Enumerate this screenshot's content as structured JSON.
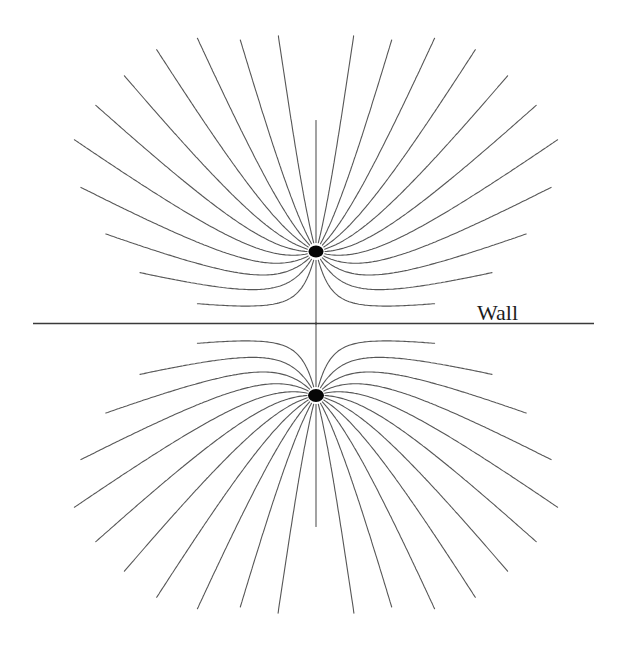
{
  "canvas": {
    "width": 628,
    "height": 645,
    "background": "#ffffff"
  },
  "wall": {
    "label": "Wall",
    "y": 323.5,
    "x1": 33,
    "x2": 594,
    "color": "#3a3a3a",
    "thickness": 1.7,
    "label_x": 477,
    "label_baseline_y": 320,
    "label_font_size": 22,
    "label_color": "#1d1d1d"
  },
  "sources": [
    {
      "id": "upper-source-dot",
      "x": 316,
      "y": 251.5,
      "rx": 7.5,
      "ry": 6,
      "color": "#060606",
      "away": "up"
    },
    {
      "id": "lower-source-dot",
      "x": 316,
      "y": 395.5,
      "rx": 8,
      "ry": 6.5,
      "color": "#060606",
      "away": "down"
    }
  ],
  "streamlines": {
    "rays_per_source": 24,
    "angle_step_deg": 15,
    "start_radius": 9,
    "color": "#575757",
    "thickness": 1.1,
    "integration_step": 2,
    "max_length_by_angle_deg": {
      "0": 130,
      "15": 220,
      "30": 225,
      "45": 245,
      "60": 258,
      "75": 262,
      "90": 268,
      "105": 272,
      "120": 252,
      "135": 222,
      "150": 192,
      "165": 148,
      "180": 72.5
    },
    "clip": {
      "x_min": 30,
      "x_max": 601,
      "y_min": 34,
      "y_max": 616
    }
  }
}
